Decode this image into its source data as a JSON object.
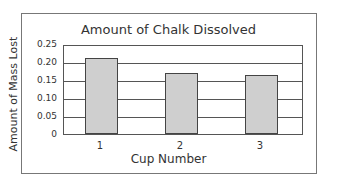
{
  "chart_data": {
    "type": "bar",
    "title": "Amount of Chalk Dissolved",
    "xlabel": "Cup Number",
    "ylabel": "Amount of Mass Lost",
    "categories": [
      "1",
      "2",
      "3"
    ],
    "values": [
      0.21,
      0.17,
      0.165
    ],
    "ylim": [
      0,
      0.25
    ],
    "yticks": [
      "0",
      "0.05",
      "0.10",
      "0.15",
      "0.20",
      "0.25"
    ],
    "grid": true,
    "legend": null,
    "colors": {
      "bar_fill": "#cfcfcf",
      "bar_edge": "#444444",
      "grid": "#555555"
    }
  }
}
